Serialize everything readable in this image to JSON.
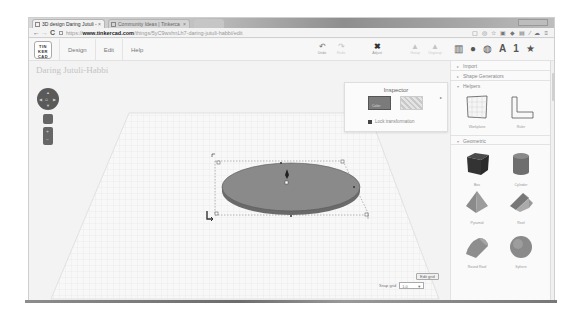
{
  "browser": {
    "tabs": [
      {
        "label": "3D design Daring Jutuli - ",
        "active": true
      },
      {
        "label": "Community Ideas | Tinkerca",
        "active": false
      }
    ],
    "url": {
      "scheme": "https://",
      "host": "www.tinkercad.com",
      "path": "/things/5yC9wxhnLh7-daring-jutuli-habbi/edit"
    },
    "nav": {
      "back": "←",
      "forward": "→",
      "reload": "C"
    },
    "extension_icons": [
      "▢",
      "◎",
      "☆",
      "▣",
      "◆",
      "▤",
      "⁄",
      "☁",
      "≡"
    ]
  },
  "app": {
    "logo_lines": [
      "TIN",
      "KER",
      "CAD"
    ],
    "menu": [
      "Design",
      "Edit",
      "Help"
    ],
    "tools": [
      {
        "label": "Undo",
        "glyph": "↶",
        "enabled": true
      },
      {
        "label": "Redo",
        "glyph": "↷",
        "enabled": false
      },
      {
        "label": "Adjust",
        "glyph": "✖",
        "enabled": true
      },
      {
        "label": "Group",
        "glyph": "▲",
        "enabled": false
      },
      {
        "label": "Ungroup",
        "glyph": "▲",
        "enabled": false
      }
    ],
    "pickers": [
      "▥",
      "●",
      "◍",
      "A",
      "1",
      "★"
    ],
    "design_title": "Daring Jutuli-Habbi"
  },
  "inspector": {
    "title": "Inspector",
    "solid_label": "Color",
    "hole_label": "Hole",
    "lock_label": "Lock transformation",
    "colors": {
      "solid": "#7b7b7b"
    }
  },
  "grid_controls": {
    "edit_grid": "Edit grid",
    "snap_label": "Snap grid",
    "snap_value": "1.0"
  },
  "panel": {
    "sections": [
      {
        "label": "Import"
      },
      {
        "label": "Shape Generators"
      },
      {
        "label": "Helpers",
        "items": [
          "Workplane",
          "Ruler"
        ]
      },
      {
        "label": "Geometric",
        "items": [
          "Box",
          "Cylinder",
          "Pyramid",
          "Roof",
          "Round Roof",
          "Sphere"
        ]
      }
    ]
  },
  "shape_on_canvas": {
    "type": "ellipse-cylinder",
    "color": "#8a8a8a"
  }
}
